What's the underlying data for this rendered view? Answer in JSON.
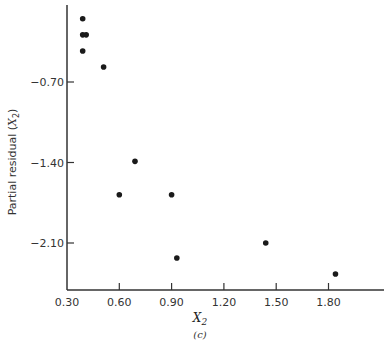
{
  "chart_data": {
    "type": "scatter",
    "title": "",
    "panel_label": "(c)",
    "xlabel": "X2",
    "xlabel_main": "X",
    "xlabel_sub": "2",
    "ylabel": "Partial residual (X2)",
    "ylabel_main": "Partial residual (",
    "ylabel_var": "X",
    "ylabel_sub": "2",
    "ylabel_close": ")",
    "xlim": [
      0.3,
      1.95
    ],
    "ylim": [
      -2.55,
      0.0
    ],
    "xticks": [
      0.3,
      0.6,
      0.9,
      1.2,
      1.5,
      1.8
    ],
    "xtick_labels": [
      "0.30",
      "0.60",
      "0.90",
      "1.20",
      "1.50",
      "1.80"
    ],
    "yticks": [
      -0.7,
      -1.4,
      -2.1
    ],
    "ytick_labels": [
      "-0.70",
      "-1.40",
      "-2.10"
    ],
    "grid": false,
    "legend": null,
    "points": [
      {
        "x": 0.39,
        "y": -0.15
      },
      {
        "x": 0.39,
        "y": -0.29
      },
      {
        "x": 0.41,
        "y": -0.29
      },
      {
        "x": 0.39,
        "y": -0.43
      },
      {
        "x": 0.51,
        "y": -0.57
      },
      {
        "x": 0.69,
        "y": -1.39
      },
      {
        "x": 0.6,
        "y": -1.68
      },
      {
        "x": 0.9,
        "y": -1.68
      },
      {
        "x": 0.93,
        "y": -2.23
      },
      {
        "x": 1.44,
        "y": -2.1
      },
      {
        "x": 1.84,
        "y": -2.37
      }
    ]
  }
}
